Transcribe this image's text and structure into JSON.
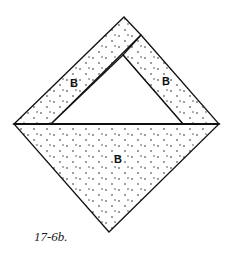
{
  "diagram": {
    "pieces": [
      {
        "id": "left-strip",
        "label": "B"
      },
      {
        "id": "right-strip",
        "label": "B"
      },
      {
        "id": "bottom-triangle",
        "label": "B"
      }
    ],
    "center_triangle": {
      "label": ""
    },
    "caption": "17-6b."
  },
  "colors": {
    "line": "#111111",
    "fill": "#ffffff",
    "dots": "#222222"
  }
}
